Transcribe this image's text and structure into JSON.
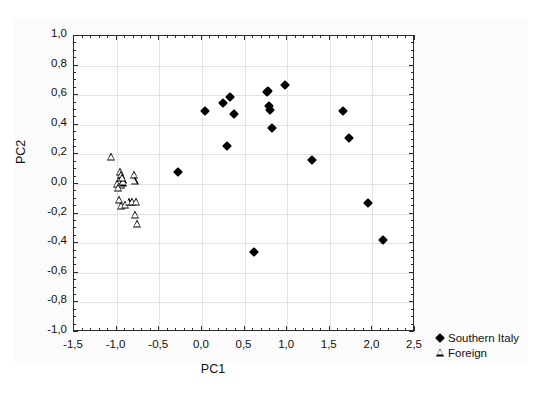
{
  "chart_data": {
    "type": "scatter",
    "title": "",
    "xlabel": "PC1",
    "ylabel": "PC2",
    "xlim": [
      -1.5,
      2.5
    ],
    "ylim": [
      -1.0,
      1.0
    ],
    "xticks": [
      "-1,5",
      "-1,0",
      "-0,5",
      "0,0",
      "0,5",
      "1,0",
      "1,5",
      "2,0",
      "2,5"
    ],
    "xtick_values": [
      -1.5,
      -1.0,
      -0.5,
      0.0,
      0.5,
      1.0,
      1.5,
      2.0,
      2.5
    ],
    "yticks": [
      "1,0",
      "0,8",
      "0,6",
      "0,4",
      "0,2",
      "0,0",
      "-0,2",
      "-0,4",
      "-0,6",
      "-0,8",
      "-1,0"
    ],
    "ytick_values": [
      1.0,
      0.8,
      0.6,
      0.4,
      0.2,
      0.0,
      -0.2,
      -0.4,
      -0.6,
      -0.8,
      -1.0
    ],
    "grid": true,
    "grid_x_values": [
      -1.0,
      -0.5,
      0.0,
      0.5,
      1.0,
      1.5,
      2.0
    ],
    "grid_y_values": [
      0.8,
      0.6,
      0.4,
      0.2,
      0.0,
      -0.2,
      -0.4,
      -0.6,
      -0.8
    ],
    "decimal_separator": ",",
    "legend_position": "right-bottom-outside",
    "series": [
      {
        "name": "Southern Italy",
        "marker": "filled-diamond",
        "color": "#000000",
        "points": [
          [
            -0.28,
            0.08
          ],
          [
            0.04,
            0.49
          ],
          [
            0.25,
            0.55
          ],
          [
            0.33,
            0.59
          ],
          [
            0.38,
            0.47
          ],
          [
            0.29,
            0.26
          ],
          [
            0.61,
            -0.46
          ],
          [
            0.76,
            0.62
          ],
          [
            0.78,
            0.63
          ],
          [
            0.79,
            0.53
          ],
          [
            0.8,
            0.5
          ],
          [
            0.82,
            0.38
          ],
          [
            0.97,
            0.67
          ],
          [
            1.29,
            0.16
          ],
          [
            1.66,
            0.49
          ],
          [
            1.72,
            0.31
          ],
          [
            1.95,
            -0.13
          ],
          [
            2.13,
            -0.38
          ]
        ]
      },
      {
        "name": "Foreign",
        "marker": "open-triangle",
        "color": "#000000",
        "points": [
          [
            -1.07,
            0.18
          ],
          [
            -0.96,
            0.08
          ],
          [
            -0.95,
            0.06
          ],
          [
            -0.93,
            0.03
          ],
          [
            -0.97,
            0.02
          ],
          [
            -0.99,
            0.0
          ],
          [
            -0.95,
            -0.01
          ],
          [
            -0.92,
            0.01
          ],
          [
            -0.94,
            0.04
          ],
          [
            -0.98,
            -0.03
          ],
          [
            -0.8,
            0.06
          ],
          [
            -0.79,
            0.02
          ],
          [
            -0.97,
            -0.11
          ],
          [
            -0.95,
            -0.15
          ],
          [
            -0.9,
            -0.14
          ],
          [
            -0.86,
            -0.12
          ],
          [
            -0.82,
            -0.12
          ],
          [
            -0.77,
            -0.12
          ],
          [
            -0.78,
            -0.21
          ],
          [
            -0.76,
            -0.27
          ]
        ]
      }
    ]
  }
}
